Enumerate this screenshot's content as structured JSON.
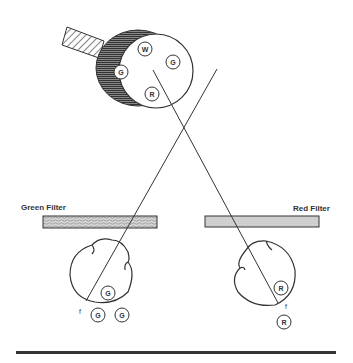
{
  "diagram": {
    "wheel": {
      "circles": [
        {
          "letter": "W",
          "x": 145,
          "y": 49
        },
        {
          "letter": "G",
          "x": 173,
          "y": 62
        },
        {
          "letter": "G",
          "x": 121,
          "y": 72
        },
        {
          "letter": "R",
          "x": 152,
          "y": 94
        }
      ]
    },
    "green_filter": {
      "label": "Green Filter"
    },
    "red_filter": {
      "label": "Red Filter"
    },
    "left_cell": {
      "inner_circle": {
        "letter": "G"
      },
      "focus_label": "f",
      "outer_circles": [
        {
          "letter": "G"
        },
        {
          "letter": "G"
        }
      ]
    },
    "right_cell": {
      "inner_circle": {
        "letter": "R"
      },
      "focus_label": "f",
      "outer_circles": [
        {
          "letter": "R"
        }
      ]
    },
    "colors": {
      "line": "#333333",
      "filter_fill": "#d8d8d8",
      "wheel_dark": "#555555"
    }
  }
}
